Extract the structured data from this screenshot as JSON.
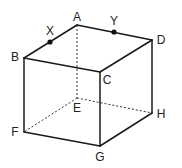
{
  "diagram": {
    "type": "cube-perspective",
    "vertices": {
      "A": {
        "x": 77,
        "y": 25,
        "label": "A",
        "lx": 77,
        "ly": 17
      },
      "B": {
        "x": 24,
        "y": 58,
        "label": "B",
        "lx": 15,
        "ly": 57
      },
      "C": {
        "x": 100,
        "y": 72,
        "label": "C",
        "lx": 107,
        "ly": 80
      },
      "D": {
        "x": 152,
        "y": 40,
        "label": "D",
        "lx": 161,
        "ly": 40
      },
      "E": {
        "x": 77,
        "y": 98,
        "label": "E",
        "lx": 77,
        "ly": 108
      },
      "F": {
        "x": 24,
        "y": 132,
        "label": "F",
        "lx": 15,
        "ly": 132
      },
      "G": {
        "x": 100,
        "y": 146,
        "label": "G",
        "lx": 100,
        "ly": 157
      },
      "H": {
        "x": 152,
        "y": 113,
        "label": "H",
        "lx": 161,
        "ly": 114
      }
    },
    "solid_edges": [
      [
        "A",
        "B"
      ],
      [
        "A",
        "D"
      ],
      [
        "B",
        "C"
      ],
      [
        "C",
        "D"
      ],
      [
        "B",
        "F"
      ],
      [
        "C",
        "G"
      ],
      [
        "D",
        "H"
      ],
      [
        "F",
        "G"
      ],
      [
        "G",
        "H"
      ]
    ],
    "hidden_edges": [
      [
        "A",
        "E"
      ],
      [
        "E",
        "F"
      ],
      [
        "E",
        "H"
      ]
    ],
    "points": [
      {
        "name": "X",
        "on_edge": [
          "A",
          "B"
        ],
        "x": 50,
        "y": 42,
        "label": "X",
        "lx": 50,
        "ly": 31
      },
      {
        "name": "Y",
        "on_edge": [
          "A",
          "D"
        ],
        "x": 114,
        "y": 32,
        "label": "Y",
        "lx": 114,
        "ly": 21
      }
    ]
  }
}
